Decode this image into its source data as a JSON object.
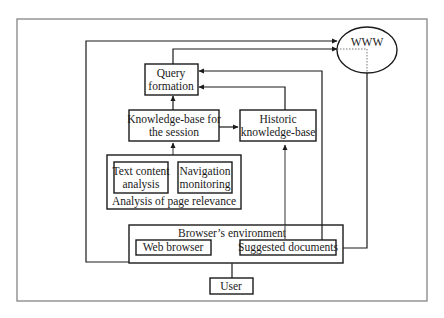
{
  "diagram": {
    "nodes": {
      "www": {
        "label": "WWW"
      },
      "query_formation": {
        "line1": "Query",
        "line2": "formation"
      },
      "kb_session": {
        "line1": "Knowledge-base for",
        "line2": "the session"
      },
      "historic_kb": {
        "line1": "Historic",
        "line2": "knowledge-base"
      },
      "text_content": {
        "line1": "Text content",
        "line2": "analysis"
      },
      "navigation": {
        "line1": "Navigation",
        "line2": "monitoring"
      },
      "page_relevance": {
        "label": "Analysis of page relevance"
      },
      "browser_env": {
        "label": "Browser’s environment"
      },
      "web_browser": {
        "label": "Web browser"
      },
      "suggested_docs": {
        "label": "Suggested documents"
      },
      "user": {
        "label": "User"
      }
    },
    "edges": [
      {
        "from": "Web browser",
        "to": "WWW"
      },
      {
        "from": "Query formation",
        "to": "WWW"
      },
      {
        "from": "Suggested documents",
        "to": "Query formation"
      },
      {
        "from": "Historic knowledge-base",
        "to": "Query formation"
      },
      {
        "from": "Knowledge-base for the session",
        "to": "Query formation"
      },
      {
        "from": "Knowledge-base for the session",
        "to": "Historic knowledge-base"
      },
      {
        "from": "Analysis of page relevance",
        "to": "Knowledge-base for the session"
      },
      {
        "from": "Suggested documents",
        "to": "Historic knowledge-base"
      },
      {
        "from": "WWW",
        "to": "Suggested documents"
      },
      {
        "from": "WWW",
        "to": "Web browser"
      },
      {
        "from": "Web browser",
        "to": "Suggested documents",
        "bidirectional": true
      },
      {
        "from": "User",
        "to": "Browser's environment",
        "bidirectional": true
      }
    ]
  }
}
